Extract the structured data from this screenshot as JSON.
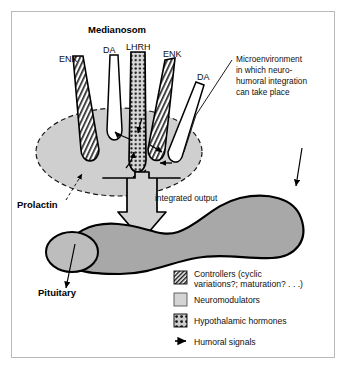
{
  "figure": {
    "title_label": "Medianosom",
    "terminal_labels": [
      {
        "id": "enk-left",
        "text": "ENK"
      },
      {
        "id": "da-left",
        "text": "DA"
      },
      {
        "id": "lhrh",
        "text": "LHRH"
      },
      {
        "id": "enk-right",
        "text": "ENK"
      },
      {
        "id": "da-right",
        "text": "DA"
      }
    ],
    "annotation": {
      "lines": [
        "Microenvironment",
        "in which neuro-",
        "humoral integration",
        "can take place"
      ]
    },
    "prolactin_label": "Prolactin",
    "integrated_output_label": "integrated output",
    "pituitary_label": "Pituitary"
  },
  "legend": {
    "items": [
      {
        "swatch": "hatch-swatch",
        "lines": [
          "Controllers (cyclic",
          "variations?; maturation? . . .)"
        ]
      },
      {
        "swatch": "solid-gray-swatch",
        "lines": [
          "Neuromodulators"
        ]
      },
      {
        "swatch": "dotted-grid-swatch",
        "lines": [
          "Hypothalamic hormones"
        ]
      },
      {
        "swatch": "arrow-swatch",
        "lines": [
          "Humoral signals"
        ]
      }
    ]
  },
  "colors": {
    "frame_border": "#b9b9b9",
    "background": "#ffffff",
    "microenvironment_fill": "#cfcfcf",
    "gland_fill": "#a8a8a8",
    "gland_lobe_fill": "#bdbdbd",
    "output_arrow_fill": "#d2d2d2",
    "hatch_dark": "#2a2a2a",
    "outline": "#000000"
  }
}
